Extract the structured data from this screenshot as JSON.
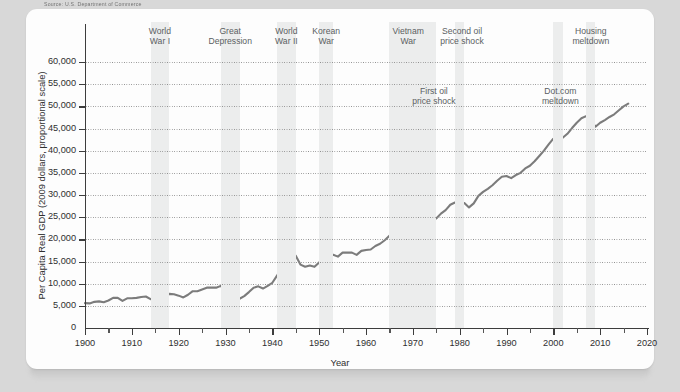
{
  "source_note": "Source: U.S. Department of Commerce",
  "chart_data": {
    "type": "line",
    "title": "",
    "xlabel": "Year",
    "ylabel": "Per Capita Real GDP (2009 dollars, proportional scale)",
    "xlim": [
      1900,
      2020
    ],
    "ylim": [
      0,
      60000
    ],
    "xticks": [
      1900,
      1910,
      1920,
      1930,
      1940,
      1950,
      1960,
      1970,
      1980,
      1990,
      2000,
      2010,
      2020
    ],
    "xtick_labels": [
      "1900",
      "1910",
      "1920",
      "1930",
      "1940",
      "1950",
      "1960",
      "1970",
      "1980",
      "1990",
      "2000",
      "2010",
      "2020"
    ],
    "xminor_step": 5,
    "yticks": [
      0,
      5000,
      10000,
      15000,
      20000,
      25000,
      30000,
      35000,
      40000,
      45000,
      50000,
      55000,
      60000
    ],
    "ytick_labels": [
      "0",
      "5,000",
      "10,000",
      "15,000",
      "20,000",
      "25,000",
      "30,000",
      "35,000",
      "40,000",
      "45,000",
      "50,000",
      "55,000",
      "60,000"
    ],
    "grid": "horizontal-dotted",
    "legend": "none",
    "series_color": "#7c7c7c",
    "band_color": "#eceded",
    "series": [
      {
        "name": "Per Capita Real GDP",
        "x": [
          1900,
          1901,
          1902,
          1903,
          1904,
          1905,
          1906,
          1907,
          1908,
          1909,
          1910,
          1911,
          1912,
          1913,
          1914,
          1915,
          1916,
          1917,
          1918,
          1919,
          1920,
          1921,
          1922,
          1923,
          1924,
          1925,
          1926,
          1927,
          1928,
          1929,
          1930,
          1931,
          1932,
          1933,
          1934,
          1935,
          1936,
          1937,
          1938,
          1939,
          1940,
          1941,
          1942,
          1943,
          1944,
          1945,
          1946,
          1947,
          1948,
          1949,
          1950,
          1951,
          1952,
          1953,
          1954,
          1955,
          1956,
          1957,
          1958,
          1959,
          1960,
          1961,
          1962,
          1963,
          1964,
          1965,
          1966,
          1967,
          1968,
          1969,
          1970,
          1971,
          1972,
          1973,
          1974,
          1975,
          1976,
          1977,
          1978,
          1979,
          1980,
          1981,
          1982,
          1983,
          1984,
          1985,
          1986,
          1987,
          1988,
          1989,
          1990,
          1991,
          1992,
          1993,
          1994,
          1995,
          1996,
          1997,
          1998,
          1999,
          2000,
          2001,
          2002,
          2003,
          2004,
          2005,
          2006,
          2007,
          2008,
          2009,
          2010,
          2011,
          2012,
          2013,
          2014,
          2015,
          2016
        ],
        "values": [
          5600,
          5550,
          5900,
          6000,
          5800,
          6200,
          6800,
          6800,
          6100,
          6700,
          6700,
          6800,
          7000,
          7100,
          6500,
          6600,
          7400,
          7200,
          7700,
          7600,
          7300,
          6900,
          7500,
          8300,
          8300,
          8700,
          9100,
          9100,
          9100,
          9500,
          8500,
          7900,
          6800,
          6600,
          7200,
          8100,
          9100,
          9400,
          8900,
          9500,
          10200,
          11800,
          13700,
          15800,
          16800,
          16300,
          14300,
          13800,
          14100,
          13800,
          14800,
          15700,
          16000,
          16500,
          16100,
          17000,
          17000,
          17000,
          16500,
          17400,
          17600,
          17700,
          18500,
          19000,
          19800,
          20800,
          21800,
          22100,
          22900,
          23300,
          23000,
          23400,
          24400,
          25500,
          25100,
          24700,
          25800,
          26600,
          27800,
          28300,
          27800,
          28200,
          27200,
          28100,
          29800,
          30700,
          31400,
          32200,
          33200,
          34100,
          34300,
          33800,
          34500,
          35000,
          36000,
          36600,
          37600,
          38800,
          40000,
          41400,
          42700,
          42600,
          42900,
          43800,
          45100,
          46300,
          47300,
          47800,
          47100,
          45400,
          46300,
          46900,
          47600,
          48200,
          49100,
          50000,
          50600
        ],
        "start_value": 5600,
        "end_value": 50600,
        "peak_1944": 16800,
        "trough_1933": 6600
      }
    ],
    "shaded_bands": [
      {
        "label": "World War I",
        "start": 1914,
        "end": 1918,
        "label_position": "top"
      },
      {
        "label": "Great Depression",
        "start": 1929,
        "end": 1933,
        "label_position": "top"
      },
      {
        "label": "World War II",
        "start": 1941,
        "end": 1945,
        "label_position": "top"
      },
      {
        "label": "Korean War",
        "start": 1950,
        "end": 1953,
        "label_position": "top"
      },
      {
        "label": "Vietnam War",
        "start": 1965,
        "end": 1973,
        "label_position": "top"
      },
      {
        "label": "First oil price shock",
        "start": 1973,
        "end": 1975,
        "label_position": "inline"
      },
      {
        "label": "Second oil price shock",
        "start": 1979,
        "end": 1981,
        "label_position": "top"
      },
      {
        "label": "Dot.com meltdown",
        "start": 2000,
        "end": 2002,
        "label_position": "inline"
      },
      {
        "label": "Housing meltdown",
        "start": 2007,
        "end": 2009,
        "label_position": "top"
      }
    ],
    "annotations": [
      {
        "text": "World War I",
        "line1": "World",
        "line2": "War I"
      },
      {
        "text": "Great Depression",
        "line1": "Great",
        "line2": "Depression"
      },
      {
        "text": "World War II",
        "line1": "World",
        "line2": "War II"
      },
      {
        "text": "Korean War",
        "line1": "Korean",
        "line2": "War"
      },
      {
        "text": "Vietnam War",
        "line1": "Vietnam",
        "line2": "War"
      },
      {
        "text": "Second oil price shock",
        "line1": "Second oil",
        "line2": "price shock"
      },
      {
        "text": "Housing meltdown",
        "line1": "Housing",
        "line2": "meltdown"
      },
      {
        "text": "First oil price shock",
        "line1": "First oil",
        "line2": "price shock"
      },
      {
        "text": "Dot.com meltdown",
        "line1": "Dot.com",
        "line2": "meltdown"
      }
    ]
  }
}
